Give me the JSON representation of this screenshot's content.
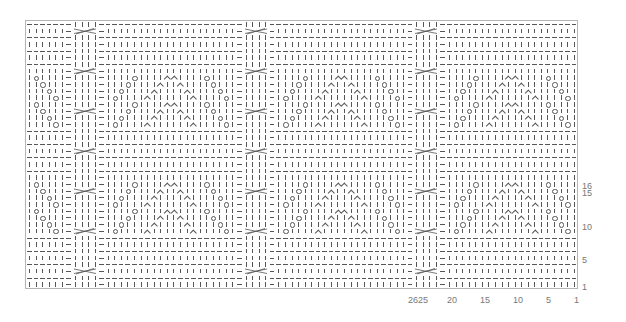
{
  "chart": {
    "title": "",
    "total_rows": 40,
    "repeat_stitches": 26,
    "row_labels": [
      {
        "label": "1",
        "y": 282
      },
      {
        "label": "5",
        "y": 255
      },
      {
        "label": "10",
        "y": 222
      },
      {
        "label": "15",
        "y": 188
      },
      {
        "label": "16",
        "y": 181
      }
    ],
    "col_labels": [
      {
        "label": "26",
        "x": 408
      },
      {
        "label": "25",
        "x": 418
      },
      {
        "label": "20",
        "x": 447
      },
      {
        "label": "15",
        "x": 480
      },
      {
        "label": "10",
        "x": 513
      },
      {
        "label": "5",
        "x": 546
      },
      {
        "label": "1",
        "x": 574
      }
    ],
    "cable_rows": [
      3,
      9,
      15,
      21,
      27,
      33,
      39
    ],
    "lace_rows": {
      "9": "|O||||λ||||||λ||||O|",
      "10": "||O||||λ||||λ||||O||",
      "11": "|||O||||λ||λ||||O|||",
      "12": "||||O||||λλ||||O||||",
      "13": "|O||||λ||||||λ||||O|",
      "14": "||O||||λ||||λ||||O||",
      "15": "|||O||||λ||λ||||O|||",
      "16": "||||O||||λλ||||O||||"
    },
    "legend": {
      "|": "knit",
      "-": "purl",
      "O": "yarn over",
      "λ": "decrease",
      "cable": "4-st cable cross"
    }
  }
}
